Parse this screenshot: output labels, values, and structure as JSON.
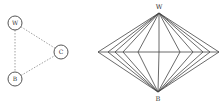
{
  "left_graph": {
    "nodes": [
      {
        "id": "W",
        "label": "W",
        "x": 15,
        "y": 23
      },
      {
        "id": "C",
        "label": "C",
        "x": 61,
        "y": 52
      },
      {
        "id": "B",
        "label": "B",
        "x": 15,
        "y": 79
      }
    ],
    "edges": [
      {
        "from": "W",
        "to": "C",
        "style": "dashed"
      },
      {
        "from": "W",
        "to": "B",
        "style": "dashed"
      },
      {
        "from": "B",
        "to": "C",
        "style": "dashed"
      }
    ],
    "node_radius": 7,
    "stroke_color": "#555555",
    "edge_color": "#888888"
  },
  "right_graph": {
    "top_vertex": {
      "label": "W",
      "x": 159,
      "y": 13
    },
    "bottom_vertex": {
      "label": "B",
      "x": 158,
      "y": 92
    },
    "horizontal_line": {
      "y": 52,
      "x_start": 98,
      "x_end": 219
    },
    "middle_points_x": [
      98,
      108,
      115,
      123,
      138,
      159,
      180,
      193,
      203,
      210,
      219
    ],
    "stroke_color": "#444444"
  }
}
